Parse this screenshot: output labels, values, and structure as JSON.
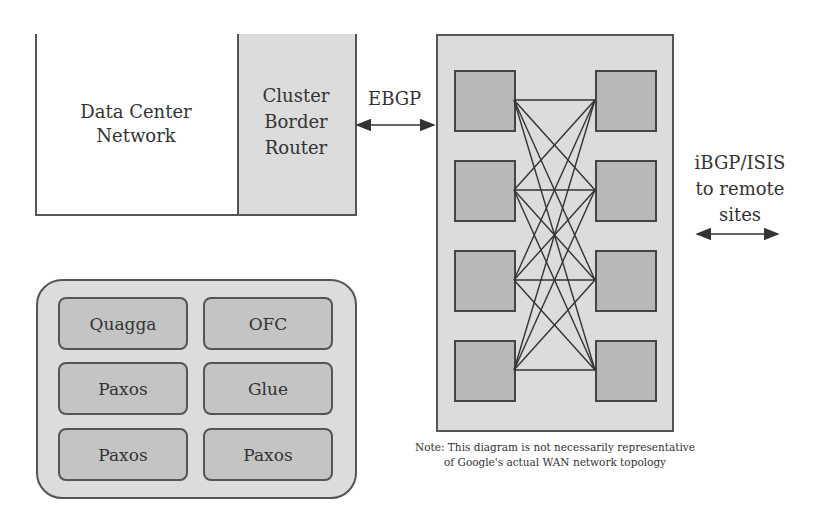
{
  "data_center": {
    "label_line1": "Data Center",
    "label_line2": "Network"
  },
  "border_router": {
    "label_line1": "Cluster",
    "label_line2": "Border",
    "label_line3": "Router"
  },
  "links": {
    "ebgp_label": "EBGP",
    "remote_line1": "iBGP/ISIS",
    "remote_line2": "to remote",
    "remote_line3": "sites"
  },
  "wan_fabric": {
    "left_switch_count": 4,
    "right_switch_count": 4,
    "topology": "full-mesh between left and right columns"
  },
  "control_services": {
    "items": [
      {
        "label": "Quagga"
      },
      {
        "label": "OFC"
      },
      {
        "label": "Paxos"
      },
      {
        "label": "Glue"
      },
      {
        "label": "Paxos"
      },
      {
        "label": "Paxos"
      }
    ]
  },
  "note": {
    "line1": "Note: This diagram is not necessarily representative",
    "line2": "of Google's actual WAN network topology"
  },
  "colors": {
    "panel_fill": "#dcdcdc",
    "switch_fill": "#b8b8b8",
    "service_fill": "#c4c4c4",
    "stroke": "#444444"
  }
}
